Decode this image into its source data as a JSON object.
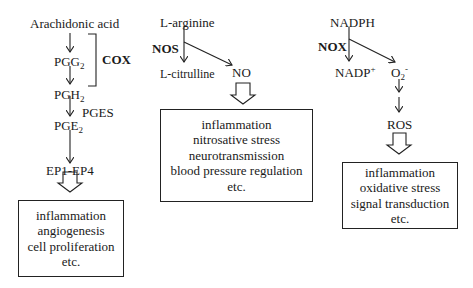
{
  "cox_pathway": {
    "substrate": "Arachidonic acid",
    "enzyme": "COX",
    "pgg": "PGG",
    "pgg_sub": "2",
    "pgh": "PGH",
    "pgh_sub": "2",
    "pges": "PGES",
    "pge": "PGE",
    "pge_sub": "2",
    "receptors": "EP1-EP4",
    "effects": [
      "inflammation",
      "angiogenesis",
      "cell proliferation",
      "etc."
    ]
  },
  "nos_pathway": {
    "substrate": "L-arginine",
    "enzyme": "NOS",
    "byproduct": "L-citrulline",
    "product": "NO",
    "effects": [
      "inflammation",
      "nitrosative stress",
      "neurotransmission",
      "blood pressure regulation",
      "etc."
    ]
  },
  "nox_pathway": {
    "substrate": "NADPH",
    "enzyme": "NOX",
    "byproduct": "NADP",
    "byproduct_sup": "+",
    "product": "O",
    "product_sub": "2",
    "product_sup": "-",
    "final": "ROS",
    "effects": [
      "inflammation",
      "oxidative stress",
      "signal transduction",
      "etc."
    ]
  }
}
